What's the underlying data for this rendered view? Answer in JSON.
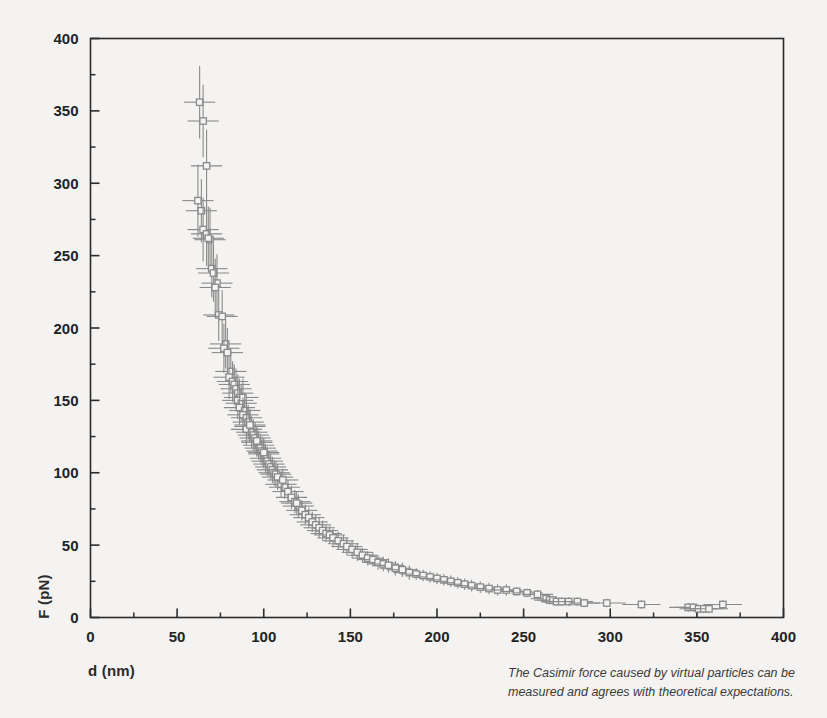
{
  "figure": {
    "background_color": "#f4f3f1",
    "frame_color": "#2b2b2b",
    "marker_color": "#8a8a8a",
    "errorbar_color": "#8a8a8a",
    "caption": "The Casimir force caused by virtual particles can be measured and agrees with theoretical expectations."
  },
  "chart_data": {
    "type": "scatter",
    "title": "",
    "xlabel": "d (nm)",
    "ylabel": "F (pN)",
    "xlim": [
      0,
      400
    ],
    "ylim": [
      0,
      400
    ],
    "xticks": [
      0,
      50,
      100,
      150,
      200,
      250,
      300,
      350,
      400
    ],
    "yticks": [
      0,
      50,
      100,
      150,
      200,
      250,
      300,
      350,
      400
    ],
    "xtick_labels": [
      "0",
      "50",
      "100",
      "150",
      "200",
      "250",
      "300",
      "350",
      "400"
    ],
    "ytick_labels": [
      "0",
      "50",
      "100",
      "150",
      "200",
      "250",
      "300",
      "350",
      "400"
    ],
    "minor_tick_step": 25,
    "grid": false,
    "legend": null,
    "marker": "open-square",
    "error_bars": "both",
    "series": [
      {
        "name": "Casimir force measurement",
        "x": [
          63,
          65,
          67,
          62,
          64,
          65,
          67,
          69,
          68,
          70,
          71,
          73,
          72,
          74,
          76,
          78,
          77,
          79,
          81,
          80,
          82,
          83,
          84,
          85,
          86,
          85,
          87,
          88,
          86,
          89,
          88,
          90,
          91,
          92,
          90,
          93,
          94,
          92,
          95,
          96,
          97,
          98,
          96,
          99,
          100,
          101,
          102,
          100,
          103,
          104,
          105,
          106,
          107,
          108,
          110,
          112,
          111,
          114,
          116,
          118,
          120,
          119,
          122,
          124,
          126,
          128,
          130,
          132,
          134,
          136,
          138,
          140,
          143,
          146,
          148,
          151,
          154,
          157,
          160,
          163,
          166,
          169,
          172,
          176,
          180,
          184,
          188,
          192,
          196,
          200,
          204,
          208,
          212,
          216,
          220,
          225,
          230,
          235,
          240,
          246,
          252,
          258,
          263,
          265,
          267,
          269,
          272,
          276,
          281,
          285,
          298,
          318,
          345,
          348,
          351,
          354,
          357,
          365
        ],
        "y": [
          356,
          343,
          312,
          288,
          281,
          268,
          265,
          261,
          262,
          241,
          238,
          231,
          228,
          209,
          208,
          189,
          186,
          183,
          170,
          166,
          163,
          161,
          158,
          155,
          152,
          150,
          148,
          152,
          145,
          143,
          140,
          138,
          135,
          132,
          130,
          128,
          126,
          133,
          124,
          121,
          119,
          117,
          122,
          115,
          113,
          110,
          108,
          114,
          106,
          104,
          102,
          100,
          99,
          97,
          92,
          90,
          95,
          87,
          83,
          80,
          77,
          79,
          74,
          71,
          69,
          66,
          64,
          62,
          60,
          58,
          57,
          55,
          53,
          51,
          49,
          47,
          45,
          43,
          41,
          40,
          38,
          37,
          36,
          34,
          33,
          31,
          30,
          29,
          28,
          27,
          26,
          25,
          24,
          23,
          22,
          21,
          20,
          19,
          19,
          18,
          17,
          16,
          13,
          12,
          12,
          11,
          11,
          11,
          11,
          10,
          10,
          9,
          7,
          7,
          6,
          6,
          6,
          9
        ],
        "xerr": [
          9,
          9,
          9,
          9,
          9,
          9,
          9,
          9,
          9,
          9,
          9,
          9,
          9,
          9,
          9,
          9,
          9,
          9,
          9,
          9,
          9,
          9,
          9,
          9,
          9,
          9,
          9,
          9,
          9,
          9,
          9,
          9,
          9,
          9,
          9,
          9,
          9,
          9,
          9,
          9,
          9,
          9,
          9,
          9,
          9,
          9,
          9,
          9,
          9,
          9,
          9,
          9,
          9,
          9,
          9,
          9,
          9,
          9,
          9,
          9,
          9,
          9,
          9,
          9,
          9,
          9,
          9,
          9,
          9,
          9,
          9,
          9,
          9,
          9,
          9,
          9,
          9,
          9,
          9,
          9,
          9,
          9,
          9,
          9,
          9,
          9,
          9,
          9,
          9,
          9,
          9,
          9,
          9,
          9,
          9,
          9,
          9,
          9,
          9,
          9,
          9,
          9,
          9,
          9,
          9,
          9,
          9,
          9,
          9,
          9,
          11,
          11,
          11,
          11,
          11,
          11,
          11,
          11
        ],
        "yerr": [
          25,
          25,
          25,
          25,
          22,
          22,
          22,
          22,
          22,
          20,
          20,
          20,
          20,
          18,
          18,
          17,
          17,
          17,
          15,
          15,
          14,
          14,
          14,
          13,
          13,
          13,
          13,
          13,
          12,
          12,
          12,
          12,
          12,
          11,
          11,
          11,
          11,
          11,
          11,
          10,
          10,
          10,
          10,
          10,
          10,
          10,
          10,
          10,
          9,
          9,
          9,
          9,
          9,
          9,
          9,
          8,
          8,
          8,
          8,
          8,
          8,
          8,
          7,
          7,
          7,
          7,
          7,
          7,
          7,
          6,
          6,
          6,
          6,
          6,
          6,
          6,
          6,
          5,
          5,
          5,
          5,
          5,
          5,
          5,
          5,
          5,
          4,
          4,
          4,
          4,
          4,
          4,
          4,
          4,
          4,
          4,
          4,
          4,
          4,
          3,
          3,
          3,
          3,
          3,
          3,
          3,
          3,
          3,
          3,
          3,
          3,
          3,
          3,
          3,
          3,
          3,
          3,
          3
        ]
      }
    ]
  }
}
